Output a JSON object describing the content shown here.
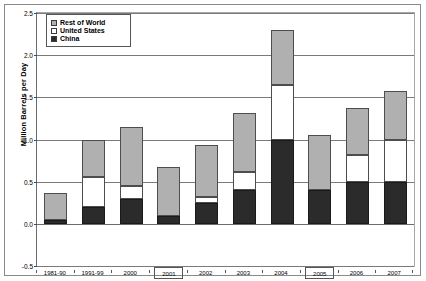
{
  "chart_data": {
    "type": "bar",
    "stacked": true,
    "title": "",
    "xlabel": "",
    "ylabel": "Million Barrels per Day",
    "ylim": [
      -0.5,
      2.5
    ],
    "ytick_values": [
      -0.5,
      0.0,
      0.5,
      1.0,
      1.5,
      2.0,
      2.5
    ],
    "ytick_labels": [
      "-0.5",
      "0.0",
      "0.5",
      "1.0",
      "1.5",
      "2.0",
      "2.5"
    ],
    "grid": true,
    "legend_position": "top-left",
    "categories": [
      "1981-90",
      "1991-99",
      "2000",
      "2001",
      "2002",
      "2003",
      "2004",
      "2005",
      "2006",
      "2007"
    ],
    "highlighted_categories": [
      "2001",
      "2005"
    ],
    "series": [
      {
        "name": "China",
        "color": "#2b2b2b",
        "values": [
          0.05,
          0.2,
          0.3,
          0.09,
          0.25,
          0.4,
          1.0,
          0.4,
          0.5,
          0.5
        ]
      },
      {
        "name": "United States",
        "color": "#ffffff",
        "values": [
          0.0,
          0.35,
          0.15,
          0.0,
          0.07,
          0.22,
          0.65,
          0.0,
          0.32,
          0.5
        ]
      },
      {
        "name": "Rest of World",
        "color": "#b0b0b0",
        "values": [
          0.32,
          0.45,
          0.7,
          0.59,
          0.61,
          0.7,
          0.65,
          0.65,
          0.55,
          0.57
        ]
      }
    ],
    "totals": [
      0.37,
      1.0,
      1.15,
      0.68,
      0.93,
      1.32,
      2.3,
      1.05,
      1.37,
      1.57
    ]
  },
  "legend": {
    "items": [
      {
        "label": "Rest of World",
        "swatch": "row"
      },
      {
        "label": "United States",
        "swatch": "us"
      },
      {
        "label": "China",
        "swatch": "china"
      }
    ]
  }
}
